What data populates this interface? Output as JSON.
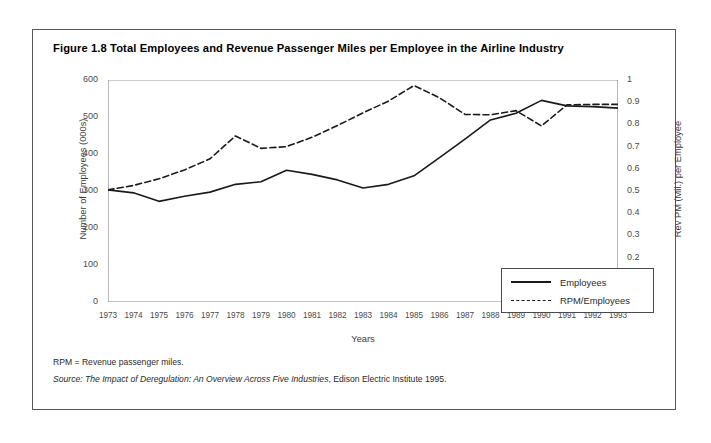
{
  "figure": {
    "title": "Figure 1.8 Total Employees and Revenue Passenger Miles per Employee in the Airline Industry",
    "notes": {
      "rpm_definition": "RPM = Revenue passenger miles.",
      "source_prefix": "Source: ",
      "source_italic": "The Impact of Deregulation: An Overview Across Five Industries",
      "source_suffix": ", Edison Electric Institute 1995."
    }
  },
  "chart_data": {
    "type": "line",
    "title": "Figure 1.8 Total Employees and Revenue Passenger Miles per Employee in the Airline Industry",
    "xlabel": "Years",
    "ylabel": "Number of Employees (000s)",
    "y2label": "Rev PM (Mil.) per Employee",
    "grid": false,
    "legend_position": "inside-bottom-right",
    "categories": [
      1973,
      1974,
      1975,
      1976,
      1977,
      1978,
      1979,
      1980,
      1981,
      1982,
      1983,
      1984,
      1985,
      1986,
      1987,
      1988,
      1989,
      1990,
      1991,
      1992,
      1993
    ],
    "xtick_labels": [
      "1973",
      "1974",
      "1975",
      "1976",
      "1977",
      "1978",
      "1979",
      "1980",
      "1981",
      "1982",
      "1983",
      "1984",
      "1985",
      "1986",
      "1987",
      "1988",
      "1989",
      "1990",
      "1991",
      "1992",
      "1993"
    ],
    "ylim": [
      0,
      600
    ],
    "ytick_labels": [
      "0",
      "100",
      "200",
      "300",
      "400",
      "500",
      "600"
    ],
    "ytick_values": [
      0,
      100,
      200,
      300,
      400,
      500,
      600
    ],
    "y2lim": [
      0,
      1
    ],
    "y2tick_labels": [
      "0",
      "0.1",
      "0.2",
      "0.3",
      "0.4",
      "0.5",
      "0.6",
      "0.7",
      "0.8",
      "0.9",
      "1"
    ],
    "y2tick_values": [
      0,
      0.1,
      0.2,
      0.3,
      0.4,
      0.5,
      0.6,
      0.7,
      0.8,
      0.9,
      1
    ],
    "series": [
      {
        "name": "Employees",
        "axis": "left",
        "style": "solid",
        "color": "#1a1a1a",
        "values": [
          303,
          295,
          272,
          286,
          297,
          318,
          325,
          356,
          345,
          330,
          308,
          318,
          341,
          390,
          440,
          492,
          510,
          545,
          530,
          528,
          524
        ]
      },
      {
        "name": "RPM/Employees",
        "axis": "right",
        "style": "dashed",
        "color": "#1a1a1a",
        "values": [
          0.505,
          0.525,
          0.555,
          0.595,
          0.645,
          0.748,
          0.692,
          0.7,
          0.742,
          0.795,
          0.852,
          0.905,
          0.975,
          0.92,
          0.845,
          0.843,
          0.862,
          0.793,
          0.888,
          0.89,
          0.89
        ]
      }
    ]
  },
  "legend": {
    "items": [
      {
        "label": "Employees",
        "style": "solid"
      },
      {
        "label": "RPM/Employees",
        "style": "dashed"
      }
    ]
  }
}
